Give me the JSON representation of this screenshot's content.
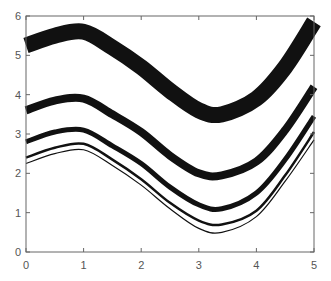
{
  "chart_data": {
    "type": "line",
    "title": "",
    "xlabel": "",
    "ylabel": "",
    "xlim": [
      0,
      5
    ],
    "ylim": [
      0,
      6
    ],
    "grid": false,
    "legend": null,
    "x_ticks": [
      "0",
      "1",
      "2",
      "3",
      "4",
      "5"
    ],
    "y_ticks": [
      "0",
      "1",
      "2",
      "3",
      "4",
      "5",
      "6"
    ],
    "x": [
      0,
      0.5,
      1,
      1.5,
      2,
      2.5,
      3,
      3.4,
      4,
      4.5,
      5
    ],
    "series": [
      {
        "name": "line-1 (thickest)",
        "line_width": 16,
        "values": [
          5.25,
          5.5,
          5.6,
          5.2,
          4.7,
          4.1,
          3.6,
          3.5,
          3.9,
          4.7,
          5.85
        ]
      },
      {
        "name": "line-2",
        "line_width": 8,
        "values": [
          3.6,
          3.85,
          3.9,
          3.5,
          3.05,
          2.45,
          2.0,
          1.95,
          2.3,
          3.1,
          4.2
        ]
      },
      {
        "name": "line-3",
        "line_width": 5,
        "values": [
          2.8,
          3.05,
          3.1,
          2.7,
          2.25,
          1.65,
          1.2,
          1.1,
          1.5,
          2.35,
          3.45
        ]
      },
      {
        "name": "line-4",
        "line_width": 2.5,
        "values": [
          2.4,
          2.65,
          2.75,
          2.35,
          1.85,
          1.25,
          0.8,
          0.7,
          1.05,
          1.95,
          3.05
        ]
      },
      {
        "name": "line-5 (thinnest)",
        "line_width": 1.2,
        "values": [
          2.25,
          2.5,
          2.6,
          2.2,
          1.7,
          1.1,
          0.6,
          0.5,
          0.9,
          1.8,
          2.85
        ]
      }
    ],
    "colors": {
      "lines": "#111111",
      "axes": "#666666",
      "tick_labels": "#555555"
    }
  }
}
